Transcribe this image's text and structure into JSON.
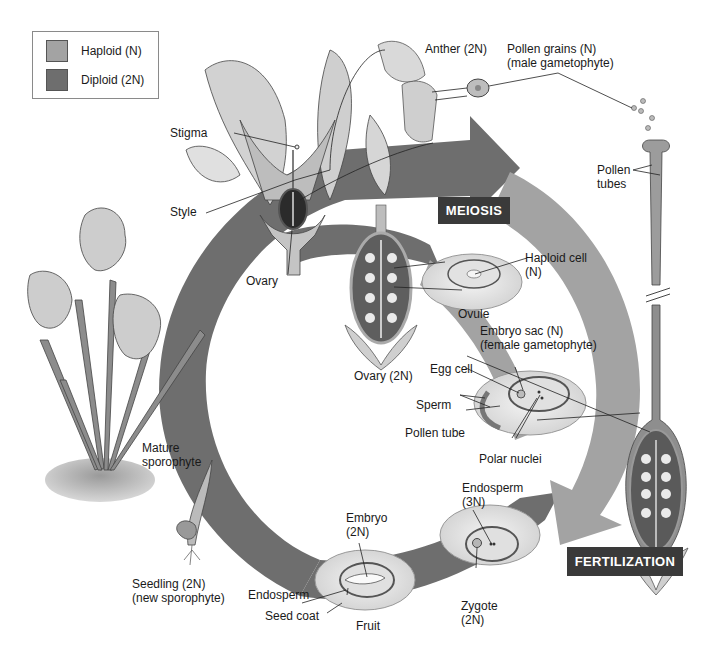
{
  "diagram": {
    "colors": {
      "haploid": "#a3a3a3",
      "diploid": "#6e6e6e",
      "stage_box": "#3a3a3a",
      "background": "#ffffff"
    },
    "legend": {
      "items": [
        {
          "label": "Haploid (N)",
          "color": "#a3a3a3"
        },
        {
          "label": "Diploid (2N)",
          "color": "#6e6e6e"
        }
      ]
    },
    "stages": {
      "meiosis": "MEIOSIS",
      "fertilization": "FERTILIZATION"
    },
    "labels": {
      "anther": "Anther (2N)",
      "pollen_grains": [
        "Pollen grains (N)",
        "(male gametophyte)"
      ],
      "pollen_tubes": [
        "Pollen",
        "tubes"
      ],
      "stigma": "Stigma",
      "style": "Style",
      "ovary": "Ovary",
      "haploid_cell": [
        "Haploid cell",
        "(N)"
      ],
      "ovule": "Ovule",
      "embryo_sac": [
        "Embryo sac (N)",
        "(female gametophyte)"
      ],
      "ovary_2n": "Ovary (2N)",
      "egg_cell": "Egg cell",
      "sperm": "Sperm",
      "pollen_tube": "Pollen tube",
      "polar_nuclei": "Polar nuclei",
      "mature_sporophyte": [
        "Mature",
        "sporophyte"
      ],
      "endosperm_3n": [
        "Endosperm",
        "(3N)"
      ],
      "embryo": [
        "Embryo",
        "(2N)"
      ],
      "zygote": [
        "Zygote",
        "(2N)"
      ],
      "seedling": [
        "Seedling (2N)",
        "(new sporophyte)"
      ],
      "endosperm": "Endosperm",
      "seed_coat": "Seed coat",
      "fruit": "Fruit"
    }
  }
}
